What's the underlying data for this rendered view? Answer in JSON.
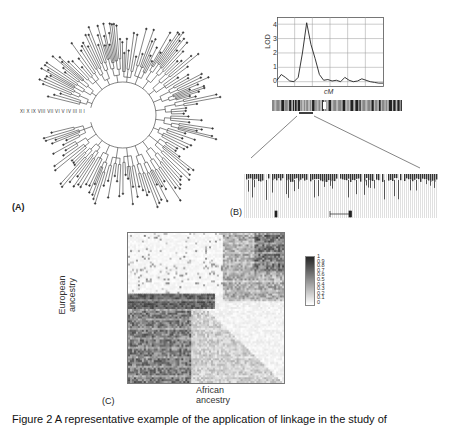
{
  "figure": {
    "panels": {
      "A": {
        "label": "(A)",
        "type": "circular-dendrogram",
        "clade_labels": [
          "XI",
          "X",
          "IX",
          "VIII",
          "VII",
          "VI",
          "V",
          "IV",
          "III",
          "II",
          "I"
        ]
      },
      "B": {
        "label": "(B)",
        "lod_plot": {
          "ylabel": "LOD",
          "xlabel": "cM",
          "yticks": [
            "4",
            "3",
            "2",
            "1",
            "0"
          ]
        }
      },
      "C": {
        "label": "(C)",
        "ylabel_line1": "European",
        "ylabel_line2": "ancestry",
        "xlabel_line1": "African",
        "xlabel_line2": "ancestry",
        "colorbar_ticks": [
          "1",
          "0.9",
          "0.8",
          "0.7",
          "0.6",
          "0.5",
          "0.4",
          "0.3",
          "0.2",
          "0.1",
          "0"
        ]
      }
    },
    "caption": "Figure 2  A representative example of the application of linkage in the study of"
  },
  "chart_data": [
    {
      "type": "line",
      "title": "",
      "xlabel": "cM",
      "ylabel": "LOD",
      "ylim": [
        -0.3,
        4.5
      ],
      "grid": true,
      "x": [
        0,
        4,
        8,
        12,
        16,
        20,
        24,
        28,
        32,
        36,
        40,
        44,
        48,
        52,
        56,
        60,
        64,
        68,
        72,
        76,
        80,
        84,
        88,
        92,
        96,
        100
      ],
      "series": [
        {
          "name": "LOD",
          "values": [
            0.1,
            0.5,
            0.3,
            0.05,
            0.0,
            0.3,
            2.0,
            4.1,
            2.6,
            1.6,
            0.5,
            0.1,
            0.15,
            0.05,
            0.1,
            0.0,
            0.3,
            0.1,
            0.0,
            0.05,
            0.2,
            0.1,
            0.0,
            -0.05,
            -0.1,
            -0.1
          ]
        }
      ]
    },
    {
      "type": "heatmap",
      "title": "",
      "xlabel": "African ancestry",
      "ylabel": "European ancestry",
      "colorbar": {
        "min": 0,
        "max": 1,
        "ticks": [
          1,
          0.9,
          0.8,
          0.7,
          0.6,
          0.5,
          0.4,
          0.3,
          0.2,
          0.1,
          0
        ]
      }
    }
  ]
}
